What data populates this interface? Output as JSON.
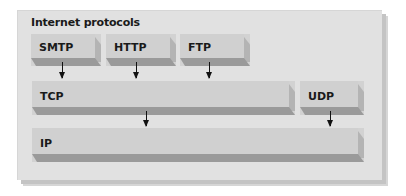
{
  "diagram": {
    "title": "Internet protocols",
    "application_layer": [
      {
        "label": "SMTP"
      },
      {
        "label": "HTTP"
      },
      {
        "label": "FTP"
      }
    ],
    "transport_layer": [
      {
        "label": "TCP"
      },
      {
        "label": "UDP"
      }
    ],
    "network_layer": [
      {
        "label": "IP"
      }
    ],
    "connections": [
      {
        "from": "SMTP",
        "to": "TCP"
      },
      {
        "from": "HTTP",
        "to": "TCP"
      },
      {
        "from": "FTP",
        "to": "TCP"
      },
      {
        "from": "TCP",
        "to": "IP"
      },
      {
        "from": "UDP",
        "to": "IP"
      }
    ]
  }
}
